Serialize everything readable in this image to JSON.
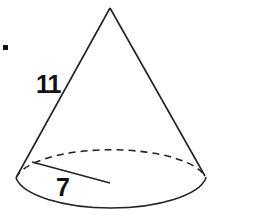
{
  "diagram": {
    "type": "cone",
    "labels": {
      "slant_height": "11",
      "radius": "7"
    },
    "stroke_color": "#222222",
    "background_color": "#ffffff"
  }
}
